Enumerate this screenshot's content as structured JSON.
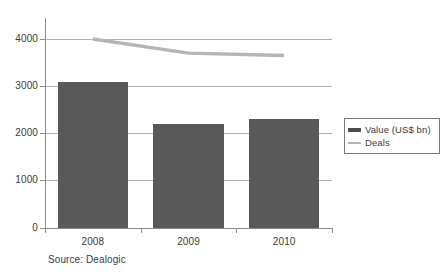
{
  "chart_data": {
    "type": "bar",
    "title": "",
    "subtitle": "",
    "xlabel": "",
    "ylabel": "",
    "categories": [
      "2008",
      "2009",
      "2010"
    ],
    "ylim": [
      0,
      4000
    ],
    "yticks": [
      0,
      1000,
      2000,
      3000,
      4000
    ],
    "ytick_labels": [
      "0",
      "1000",
      "2000",
      "3000",
      "4000"
    ],
    "grid": true,
    "legend_position": "right",
    "series": [
      {
        "name": "Value (US$ bn)",
        "type": "bar",
        "color": "#595959",
        "values": [
          3080,
          2200,
          2300
        ]
      },
      {
        "name": "Deals",
        "type": "line",
        "color": "#b5b5b5",
        "values": [
          4000,
          3700,
          3650
        ]
      }
    ],
    "annotations": [
      "Source: Dealogic"
    ]
  },
  "legend": {
    "items": [
      {
        "label": "Value (US$ bn)",
        "swatch": "thick-bar-swatch",
        "color": "#4d4d4d"
      },
      {
        "label": "Deals",
        "swatch": "thin-line-swatch",
        "color": "#b5b5b5"
      }
    ]
  },
  "axes": {
    "y_labels": [
      "4000",
      "3000",
      "2000",
      "1000",
      "0"
    ],
    "x_labels": [
      "2008",
      "2009",
      "2010"
    ]
  },
  "footer": {
    "source": "Source: Dealogic"
  }
}
